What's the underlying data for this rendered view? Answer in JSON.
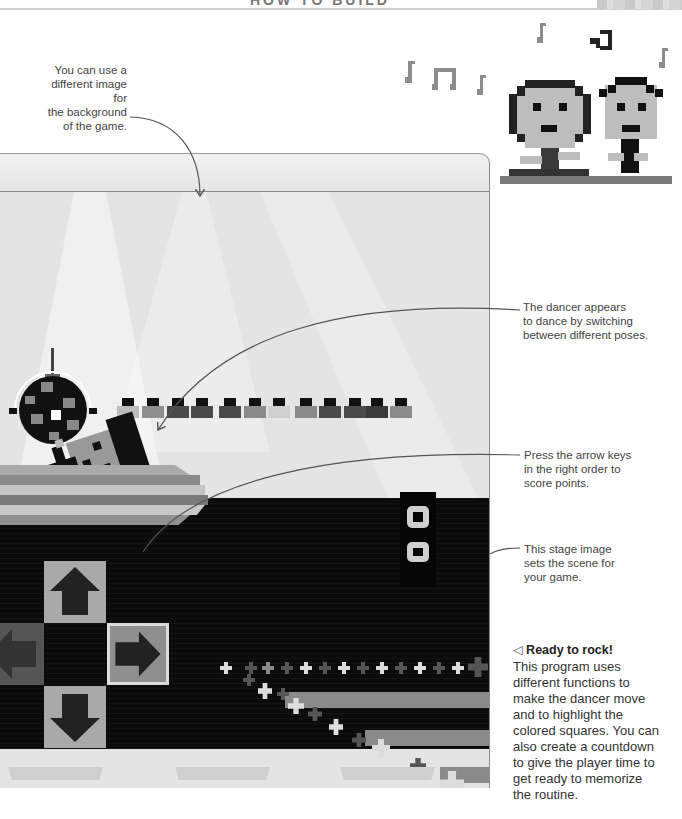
{
  "header": {
    "title": "HOW TO BUILD"
  },
  "annotations": {
    "background": [
      "You can use a",
      "different image for",
      "the background",
      "of the game."
    ],
    "dancer": [
      "The dancer appears",
      "to dance by switching",
      "between different poses."
    ],
    "arrows": [
      "Press the arrow keys",
      "in the right order to",
      "score points."
    ],
    "stage": [
      "This stage image",
      "sets the scene for",
      "your game."
    ]
  },
  "caption": {
    "icon": "◁",
    "title": "Ready to rock!",
    "body": [
      "This program uses",
      "different functions to",
      "make the dancer move",
      "and to highlight the",
      "colored squares. You can",
      "also create a countdown",
      "to give the player time to",
      "get ready to memorize",
      "the routine."
    ]
  },
  "game": {
    "audience_count": 12,
    "audience_shades": [
      "#bdbdbd",
      "#8f8f8f",
      "#4a4a4a",
      "#4a4a4a",
      "#4a4a4a",
      "#8a8a8a",
      "#cfcfcf",
      "#8a8a8a",
      "#4a4a4a",
      "#4a4a4a",
      "#3a3a3a",
      "#8a8a8a"
    ],
    "arrow_keys": [
      {
        "name": "up",
        "glyph": "up-arrow-icon",
        "active": false
      },
      {
        "name": "left",
        "glyph": "left-arrow-icon",
        "active": false
      },
      {
        "name": "right",
        "glyph": "right-arrow-icon",
        "active": true
      },
      {
        "name": "down",
        "glyph": "down-arrow-icon",
        "active": false
      }
    ]
  },
  "colors": {
    "floor": "#0b0b0b",
    "tile": "#a9a9a9",
    "tile_dark": "#555555",
    "arrow": "#222222",
    "stage_light": "#e4e4e4"
  }
}
